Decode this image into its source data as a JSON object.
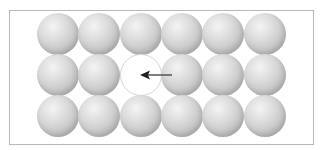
{
  "diagram": {
    "rows": 3,
    "cols": 6,
    "vacancy": {
      "row": 1,
      "col": 2
    },
    "arrow": {
      "direction": "left",
      "from_col": 3,
      "to_col": 2,
      "row": 1
    },
    "colors": {
      "sphere_light": "#f4f4f4",
      "sphere_dark": "#a6a6a6",
      "frame": "#b8b8b8",
      "arrow": "#222222"
    }
  }
}
